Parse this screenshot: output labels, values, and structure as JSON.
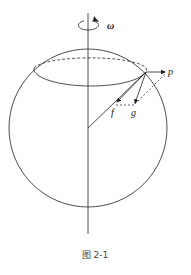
{
  "figure": {
    "caption": "图 2-1",
    "labels": {
      "omega": "ω",
      "p": "p",
      "f": "f",
      "g": "g"
    },
    "colors": {
      "stroke": "#222222",
      "background": "#ffffff"
    }
  }
}
